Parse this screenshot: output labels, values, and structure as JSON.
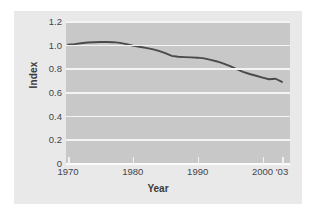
{
  "chart_data": {
    "type": "line",
    "title": "",
    "xlabel": "Year",
    "ylabel": "Index",
    "xlim": [
      1970,
      2003
    ],
    "ylim": [
      0,
      1.2
    ],
    "grid": true,
    "legend": "none",
    "y_ticks": [
      "1.2",
      "1.0",
      "0.8",
      "0.6",
      "0.4",
      "0.2",
      "0"
    ],
    "y_tick_values": [
      1.2,
      1.0,
      0.8,
      0.6,
      0.4,
      0.2,
      0
    ],
    "x_ticks": [
      "1970",
      "1980",
      "1990",
      "2000",
      "'03"
    ],
    "x_tick_values": [
      1970,
      1980,
      1990,
      2000,
      2003
    ],
    "series": [
      {
        "name": "Index",
        "color": "#4a4a4a",
        "x": [
          1970,
          1971,
          1972,
          1973,
          1974,
          1975,
          1976,
          1977,
          1978,
          1979,
          1980,
          1981,
          1982,
          1983,
          1984,
          1985,
          1986,
          1987,
          1988,
          1989,
          1990,
          1991,
          1992,
          1993,
          1994,
          1995,
          1996,
          1997,
          1998,
          1999,
          2000,
          2001,
          2002,
          2003
        ],
        "values": [
          1.0,
          1.005,
          1.012,
          1.018,
          1.021,
          1.022,
          1.022,
          1.021,
          1.015,
          1.005,
          0.992,
          0.982,
          0.973,
          0.962,
          0.948,
          0.928,
          0.905,
          0.898,
          0.895,
          0.893,
          0.89,
          0.884,
          0.872,
          0.858,
          0.84,
          0.818,
          0.793,
          0.77,
          0.752,
          0.737,
          0.722,
          0.708,
          0.712,
          0.685
        ]
      }
    ]
  },
  "axes": {
    "y_title": "Index",
    "x_title": "Year"
  },
  "colors": {
    "figure_background": "#e9e9e9",
    "plot_background": "#c8c8c8",
    "gridline": "#f4f4f4",
    "line": "#4a4a4a",
    "tick_text": "#44444a"
  }
}
